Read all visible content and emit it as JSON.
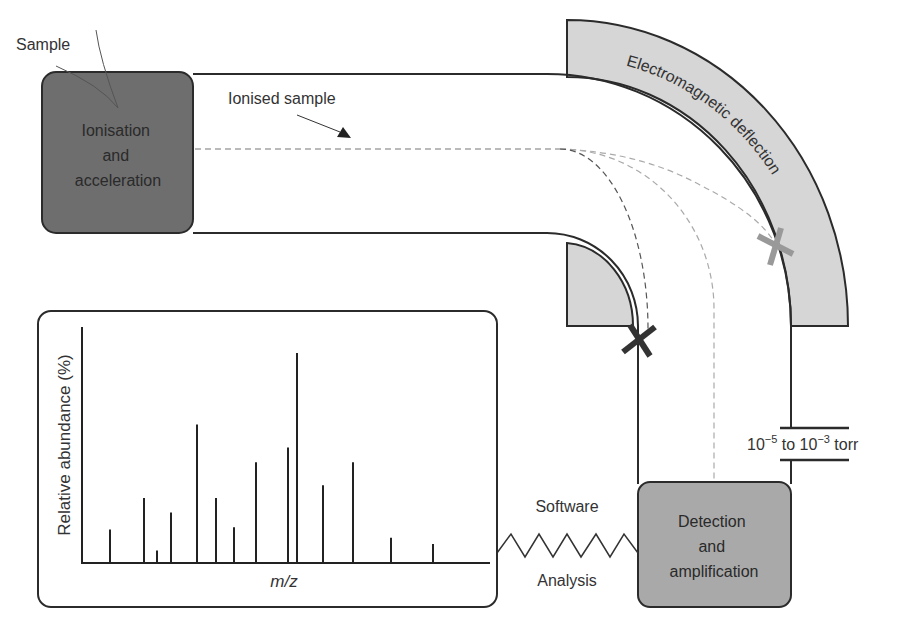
{
  "labels": {
    "sample": "Sample",
    "ionised_sample": "Ionised sample",
    "ionisation_box": [
      "Ionisation",
      "and",
      "acceleration"
    ],
    "magnet": "Electromagnetic deflection",
    "detection_box": [
      "Detection",
      "and",
      "amplification"
    ],
    "pressure_base1": "10",
    "pressure_exp1": "−5",
    "pressure_mid": " to 10",
    "pressure_exp2": "−3",
    "pressure_unit": " torr",
    "software": "Software",
    "analysis": "Analysis",
    "y_axis": "Relative abundance (%)",
    "x_axis": "m/z"
  },
  "colors": {
    "ionisation_fill": "#6e6e6e",
    "detection_fill": "#a9a9a9",
    "magnet_fill": "#d6d6d6",
    "line": "#2b2b2b",
    "beam_dark": "#555555",
    "beam_light": "#aaaaaa",
    "cross_dark": "#333333",
    "cross_light": "#999999"
  },
  "markers": [
    {
      "name": "blocked-beam-dark",
      "x": 638,
      "y": 340
    },
    {
      "name": "blocked-beam-light",
      "x": 776,
      "y": 245
    }
  ],
  "spectrum": {
    "baseline_y": 563,
    "x_positions": [
      110,
      144,
      157,
      171,
      197,
      216,
      234,
      256,
      288,
      297,
      323,
      353,
      391,
      433
    ],
    "relative_heights": [
      16,
      31,
      6,
      24,
      66,
      31,
      17,
      48,
      55,
      100,
      37,
      48,
      12,
      9
    ]
  }
}
